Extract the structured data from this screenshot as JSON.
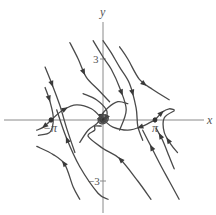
{
  "diagram": {
    "type": "phase-portrait",
    "axes": {
      "x_label": "x",
      "y_label": "y",
      "x_ticks": [
        {
          "value": -3.14159,
          "label": "−π"
        },
        {
          "value": 3.14159,
          "label": "π"
        }
      ],
      "y_ticks": [
        {
          "value": 3,
          "label": "3"
        },
        {
          "value": -3,
          "label": "−3"
        }
      ],
      "x_range": [
        -4,
        4.3
      ],
      "y_range": [
        -3.9,
        4.0
      ]
    },
    "equilibria": [
      {
        "x": 0,
        "y": 0,
        "type": "stable-spiral"
      },
      {
        "x": -3.14159,
        "y": 0,
        "type": "saddle"
      },
      {
        "x": 3.14159,
        "y": 0,
        "type": "saddle"
      }
    ],
    "trajectories": [
      {
        "name": "upper-left-1",
        "points": [
          [
            -3.5,
            1.6
          ],
          [
            -3.2,
            0.9
          ],
          [
            -3.0,
            0.1
          ],
          [
            -3.2,
            -0.6
          ],
          [
            -3.9,
            -0.75
          ]
        ],
        "arrow_at": 0.2,
        "arrow_dir": 1
      },
      {
        "name": "upper-left-2",
        "points": [
          [
            -3.5,
            2.6
          ],
          [
            -3.1,
            1.8
          ],
          [
            -2.6,
            0.7
          ],
          [
            -2.2,
            -0.4
          ],
          [
            -1.7,
            -1.6
          ]
        ],
        "arrow_at": 0.2,
        "arrow_dir": 1
      },
      {
        "name": "upper-left-3",
        "points": [
          [
            -2.0,
            3.8
          ],
          [
            -1.5,
            3.0
          ],
          [
            -1.0,
            2.1
          ],
          [
            -0.3,
            1.5
          ],
          [
            0.4,
            0.9
          ]
        ],
        "arrow_at": 0.45,
        "arrow_dir": 1
      },
      {
        "name": "upper-mid-1",
        "points": [
          [
            0.0,
            3.9
          ],
          [
            0.5,
            3.3
          ],
          [
            1.0,
            2.6
          ],
          [
            1.6,
            1.8
          ],
          [
            2.0,
            0.6
          ],
          [
            2.1,
            -0.3
          ],
          [
            2.4,
            -1.0
          ]
        ],
        "arrow_at": 0.55,
        "arrow_dir": 1
      },
      {
        "name": "upper-mid-2",
        "points": [
          [
            -0.6,
            3.9
          ],
          [
            0,
            3.1
          ],
          [
            0.5,
            2.5
          ],
          [
            1.0,
            1.6
          ],
          [
            1.4,
            0.5
          ],
          [
            1.0,
            -0.5
          ]
        ],
        "arrow_at": 0.6,
        "arrow_dir": 1
      },
      {
        "name": "upper-right-1",
        "points": [
          [
            1.0,
            3.6
          ],
          [
            1.5,
            3.0
          ],
          [
            2.2,
            2.0
          ],
          [
            3.0,
            1.5
          ],
          [
            4.0,
            1.0
          ]
        ],
        "arrow_at": 0.6,
        "arrow_dir": 1
      },
      {
        "name": "lower-left-1",
        "points": [
          [
            -4.0,
            -1.3
          ],
          [
            -3.0,
            -1.7
          ],
          [
            -2.3,
            -2.2
          ],
          [
            -1.8,
            -3.3
          ],
          [
            -1.4,
            -3.9
          ]
        ],
        "arrow_at": 0.45,
        "arrow_dir": -1
      },
      {
        "name": "lower-left-2",
        "points": [
          [
            -2.8,
            0.5
          ],
          [
            -2.2,
            -0.9
          ],
          [
            -1.4,
            -2.3
          ],
          [
            -0.3,
            -3.6
          ],
          [
            0.3,
            -3.9
          ]
        ],
        "arrow_at": 0.3,
        "arrow_dir": -1
      },
      {
        "name": "lower-mid-1",
        "points": [
          [
            -0.1,
            -0.3
          ],
          [
            -0.5,
            -0.3
          ],
          [
            -0.5,
            -0.5
          ],
          [
            -0.9,
            -0.8
          ],
          [
            0.0,
            -1.4
          ],
          [
            1.0,
            -1.9
          ],
          [
            2.1,
            -3.0
          ],
          [
            2.9,
            -3.9
          ]
        ],
        "arrow_at": 0.55,
        "arrow_dir": -1
      },
      {
        "name": "lower-right-1",
        "points": [
          [
            2.4,
            -0.5
          ],
          [
            2.9,
            -1.3
          ],
          [
            3.4,
            -2.1
          ],
          [
            4.0,
            -3.0
          ],
          [
            4.6,
            -3.9
          ]
        ],
        "arrow_at": 0.25,
        "arrow_dir": -1
      },
      {
        "name": "lower-right-2",
        "points": [
          [
            3.2,
            -0.4
          ],
          [
            3.6,
            -1.0
          ],
          [
            4.0,
            -1.8
          ],
          [
            4.3,
            -2.4
          ]
        ],
        "arrow_at": 0.2,
        "arrow_dir": -1
      },
      {
        "name": "lower-right-3",
        "points": [
          [
            4.3,
            0.45
          ],
          [
            3.7,
            0.1
          ],
          [
            3.7,
            -0.6
          ],
          [
            4.1,
            -1.2
          ],
          [
            4.5,
            -1.6
          ]
        ],
        "arrow_at": 0.7,
        "arrow_dir": -1
      },
      {
        "name": "separatrix-right-out",
        "points": [
          [
            3.14,
            0
          ],
          [
            3.6,
            0.4
          ],
          [
            4.0,
            0.55
          ],
          [
            4.3,
            0.5
          ]
        ],
        "arrow_at": 0.4,
        "arrow_dir": 1
      },
      {
        "name": "separatrix-right-in",
        "points": [
          [
            3.14,
            0
          ],
          [
            2.4,
            -0.3
          ],
          [
            1.5,
            -0.5
          ],
          [
            0.6,
            -0.35
          ],
          [
            0.1,
            -0.05
          ]
        ],
        "arrow_at": 0.3,
        "arrow_dir": 1
      },
      {
        "name": "separatrix-left-out",
        "points": [
          [
            -3.14,
            0
          ],
          [
            -2.4,
            0.5
          ],
          [
            -1.6,
            0.75
          ],
          [
            -0.7,
            0.55
          ],
          [
            -0.1,
            0.1
          ]
        ],
        "arrow_at": 0.3,
        "arrow_dir": 1
      },
      {
        "name": "separatrix-left-in",
        "points": [
          [
            -3.14,
            0
          ],
          [
            -3.6,
            -0.35
          ],
          [
            -4.0,
            -0.5
          ]
        ],
        "arrow_at": 0.5,
        "arrow_dir": 1
      },
      {
        "name": "spiral-arm-a",
        "points": [
          [
            -1.2,
            1.3
          ],
          [
            -0.4,
            1.0
          ],
          [
            0.2,
            0.5
          ],
          [
            0.2,
            0.1
          ],
          [
            0,
            0
          ]
        ],
        "arrow_at": 0.9,
        "arrow_dir": 1
      },
      {
        "name": "spiral-arm-b",
        "points": [
          [
            1.5,
            0.8
          ],
          [
            0.9,
            0.9
          ],
          [
            0.3,
            0.6
          ],
          [
            -0.1,
            0.2
          ],
          [
            0,
            0
          ]
        ],
        "arrow_at": 0.9,
        "arrow_dir": 1
      },
      {
        "name": "spiral-arm-c",
        "points": [
          [
            -1.4,
            -1.1
          ],
          [
            -0.9,
            -0.5
          ],
          [
            -0.4,
            -0.2
          ],
          [
            -0.1,
            0.1
          ],
          [
            0,
            0
          ]
        ],
        "arrow_at": 0.9,
        "arrow_dir": 1
      }
    ]
  }
}
